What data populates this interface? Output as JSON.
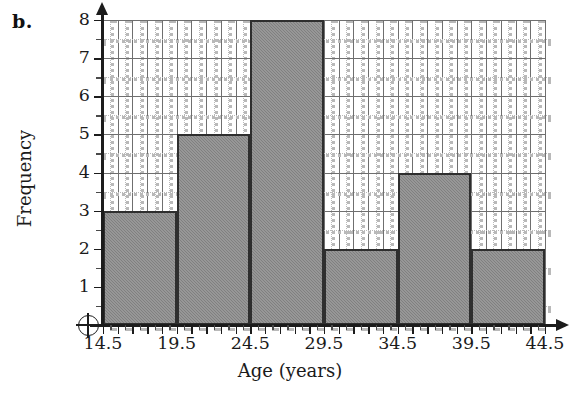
{
  "panel": {
    "letter": "b."
  },
  "chart_data": {
    "type": "bar",
    "title": "",
    "xlabel": "Age (years)",
    "ylabel": "Frequency",
    "categories": [
      "14.5-19.5",
      "19.5-24.5",
      "24.5-29.5",
      "29.5-34.5",
      "34.5-39.5",
      "39.5-44.5"
    ],
    "bin_edges": [
      14.5,
      19.5,
      24.5,
      29.5,
      34.5,
      39.5,
      44.5
    ],
    "values": [
      3,
      5,
      8,
      2,
      4,
      2
    ],
    "bin_width": 5,
    "xlim": [
      14.5,
      44.5
    ],
    "ylim": [
      0,
      8
    ],
    "xticklabels": [
      "14.5",
      "19.5",
      "24.5",
      "29.5",
      "34.5",
      "39.5",
      "44.5"
    ],
    "yticklabels": [
      "1",
      "2",
      "3",
      "4",
      "5",
      "6",
      "7",
      "8"
    ],
    "ytick_values": [
      1,
      2,
      3,
      4,
      5,
      6,
      7,
      8
    ],
    "grid": "major-solid-minor-dotted",
    "legend": "none",
    "bar_fill_color": "#8b8b8b",
    "bar_edge_color": "#2e2e2e",
    "grid_major_color": "#6f6f6f",
    "grid_minor_color": "#b9b9b9",
    "axis_color": "#1c1c1c"
  },
  "origin": {
    "symbol": "circled-plus"
  }
}
